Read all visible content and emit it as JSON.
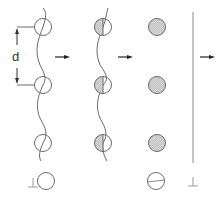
{
  "diagram": {
    "title": "",
    "labels": {
      "spacing": "d"
    },
    "columns": [
      {
        "id": "wave-open",
        "description": "open circles on wavy line",
        "circle_style": "open",
        "count": 3
      },
      {
        "id": "wave-half",
        "description": "half-hatched circles on wavy line",
        "circle_style": "half-shaded",
        "count": 3
      },
      {
        "id": "filled",
        "description": "shaded circles",
        "circle_style": "shaded",
        "count": 3
      },
      {
        "id": "line",
        "description": "vertical line",
        "circle_style": "none",
        "count": 0
      }
    ],
    "bottom_symbols": [
      {
        "id": "perp-open-circle",
        "glyph": "⊥",
        "circle": "open"
      },
      {
        "id": "split-circle",
        "glyph": "",
        "circle": "split-horizontal"
      },
      {
        "id": "perp-line",
        "glyph": "⊥",
        "circle": "none"
      }
    ],
    "arrows": 3,
    "colors": {
      "stroke": "#6a6a6a",
      "shade": "#d8d8d8",
      "arrow": "#222222",
      "light_symbol": "#9a9a9a"
    }
  }
}
